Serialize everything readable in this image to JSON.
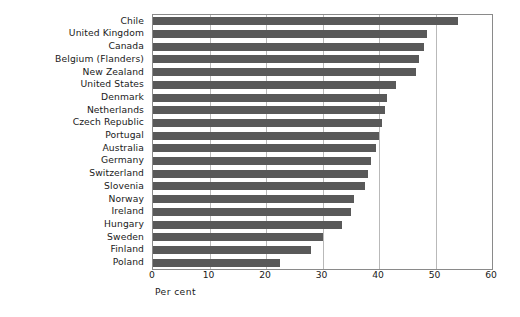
{
  "chart_data": {
    "type": "bar",
    "orientation": "horizontal",
    "title": "",
    "xlabel": "Per cent",
    "ylabel": "",
    "xlim": [
      0,
      60
    ],
    "xticks": [
      0,
      10,
      20,
      30,
      40,
      50,
      60
    ],
    "xtick_labels": [
      "0",
      "10",
      "20",
      "30",
      "40",
      "50",
      "60"
    ],
    "grid": true,
    "grid_axis": "x",
    "legend": null,
    "bar_color": "#595959",
    "categories": [
      "Chile",
      "United Kingdom",
      "Canada",
      "Belgium (Flanders)",
      "New Zealand",
      "United States",
      "Denmark",
      "Netherlands",
      "Czech Republic",
      "Portugal",
      "Australia",
      "Germany",
      "Switzerland",
      "Slovenia",
      "Norway",
      "Ireland",
      "Hungary",
      "Sweden",
      "Finland",
      "Poland"
    ],
    "values": [
      54.0,
      48.5,
      48.0,
      47.0,
      46.5,
      43.0,
      41.5,
      41.0,
      40.5,
      40.0,
      39.5,
      38.5,
      38.0,
      37.5,
      35.5,
      35.0,
      33.5,
      30.0,
      28.0,
      22.5
    ]
  }
}
